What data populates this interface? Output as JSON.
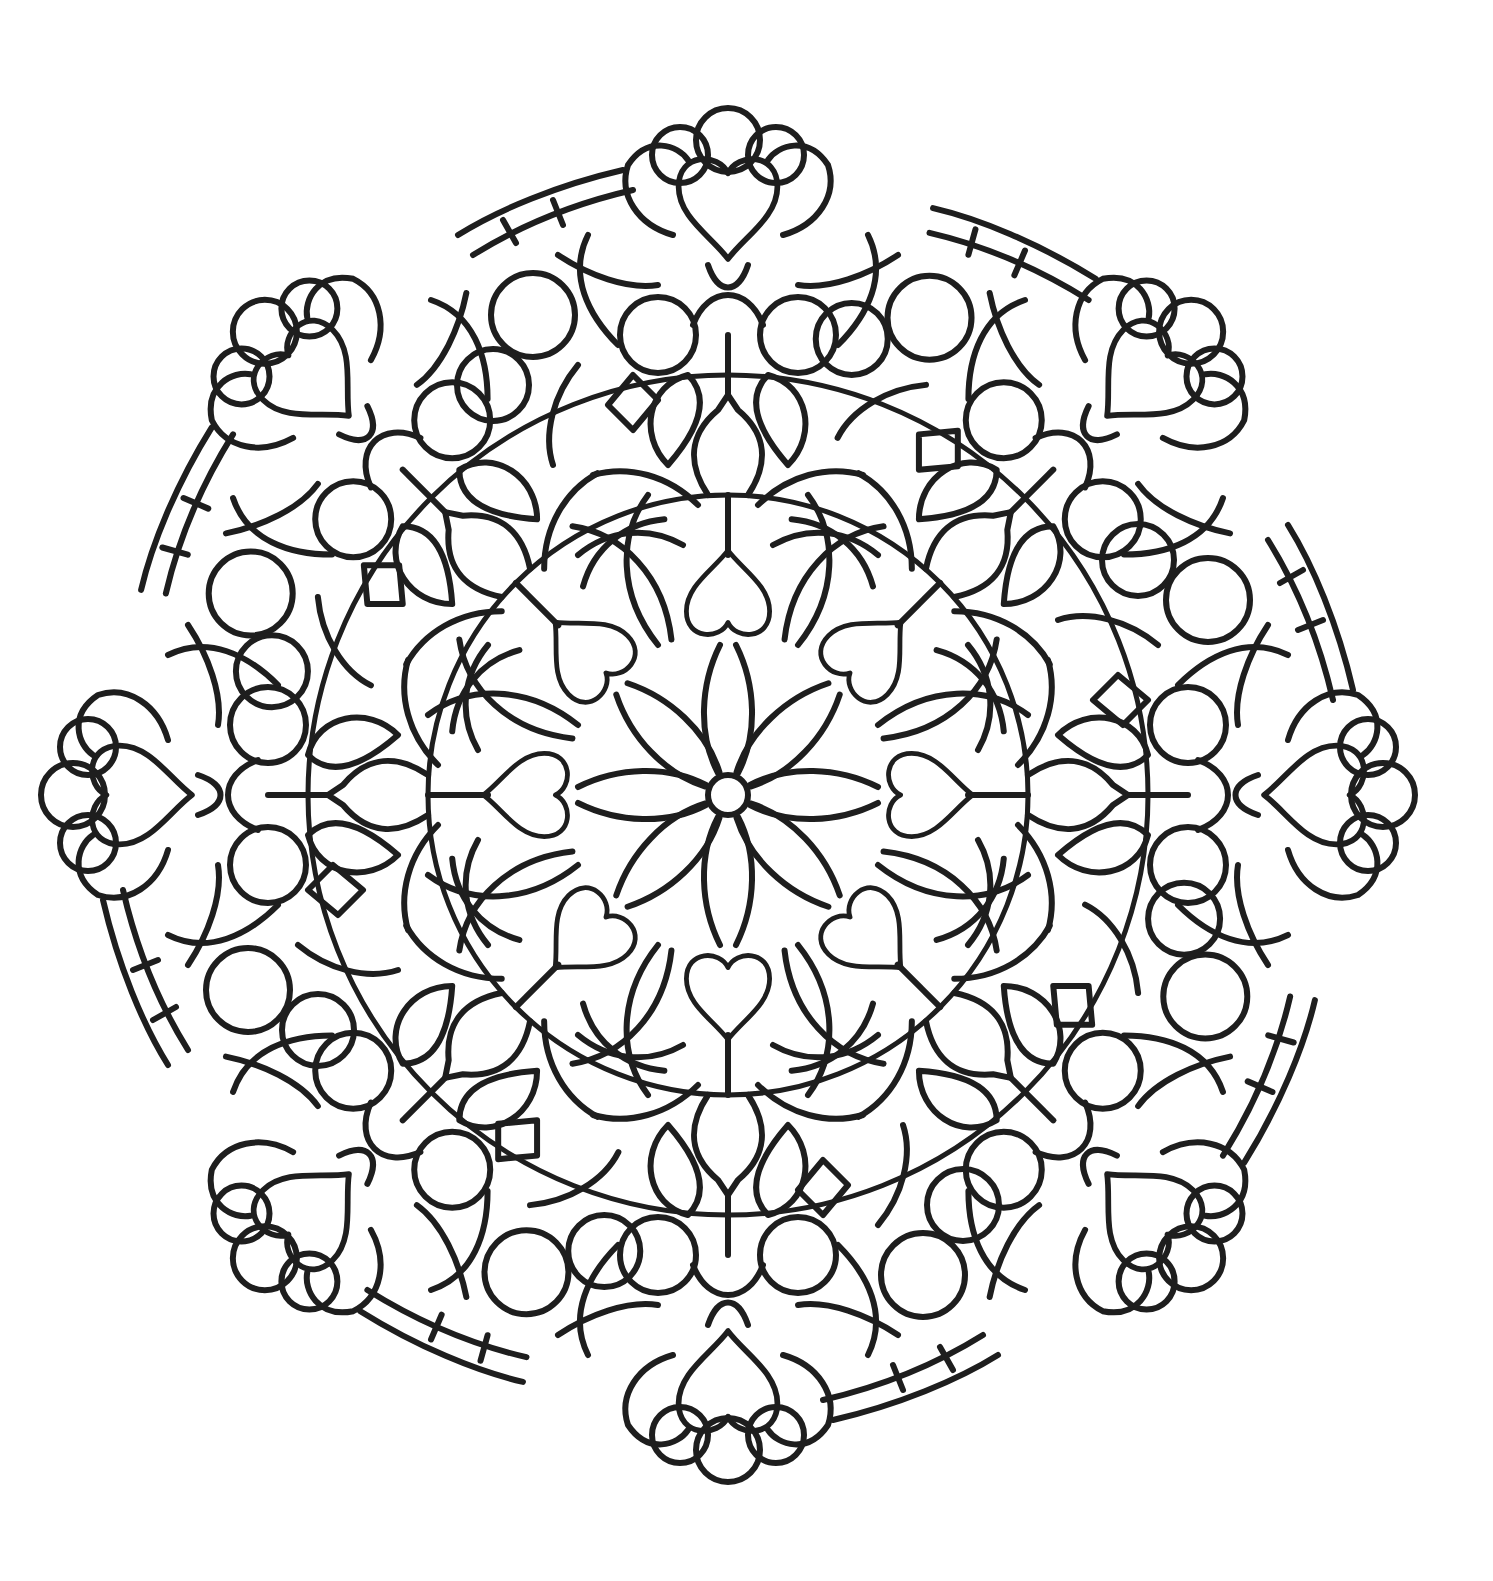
{
  "artwork": {
    "type": "mandala coloring page",
    "symmetry": 8,
    "motif": "hearts",
    "line_color": "#1e1e1e",
    "background_color": "#ffffff",
    "center": [
      728,
      795
    ],
    "outer_radius": 690
  }
}
